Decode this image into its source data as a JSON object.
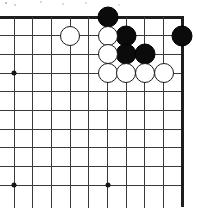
{
  "diagram": {
    "kind": "go-board-diagram",
    "title": "Go board corner position",
    "caption": "",
    "board": {
      "visible_columns": 10,
      "visible_rows": 10,
      "edges_shown": [
        "top",
        "right"
      ],
      "line_color": "#3a3a3a",
      "edge_color": "#1d1d1d",
      "background_color": "#ffffff",
      "origin_x": 14,
      "origin_y": 17,
      "spacing": 18.7
    },
    "star_points": [
      {
        "col": 0,
        "row": 3
      },
      {
        "col": 0,
        "row": 9
      },
      {
        "col": 5,
        "row": 9
      }
    ],
    "stones": [
      {
        "color": "black",
        "col": 5,
        "row": 0,
        "radius": 10.5
      },
      {
        "color": "black",
        "col": 6,
        "row": 1,
        "radius": 10.5
      },
      {
        "color": "black",
        "col": 9,
        "row": 1,
        "radius": 10.5
      },
      {
        "color": "black",
        "col": 6,
        "row": 2,
        "radius": 10.5
      },
      {
        "color": "black",
        "col": 7,
        "row": 2,
        "radius": 10.5
      },
      {
        "color": "white",
        "col": 3,
        "row": 1,
        "radius": 10.0
      },
      {
        "color": "white",
        "col": 5,
        "row": 1,
        "radius": 10.0
      },
      {
        "color": "white",
        "col": 5,
        "row": 2,
        "radius": 10.0
      },
      {
        "color": "white",
        "col": 5,
        "row": 3,
        "radius": 10.0
      },
      {
        "color": "white",
        "col": 6,
        "row": 3,
        "radius": 10.0
      },
      {
        "color": "white",
        "col": 7,
        "row": 3,
        "radius": 10.0
      },
      {
        "color": "white",
        "col": 8,
        "row": 3,
        "radius": 10.0
      }
    ],
    "colors": {
      "black_stone": "#0b0b0b",
      "white_stone": "#ffffff",
      "white_stone_border": "#1b1b1b",
      "hoshi": "#161616"
    }
  }
}
